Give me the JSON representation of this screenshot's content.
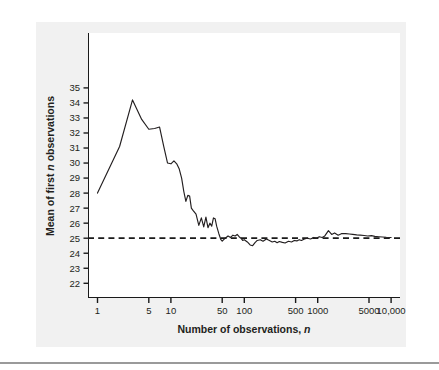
{
  "figure": {
    "background_color": "#f1f1f1",
    "plot_background_color": "#ffffff",
    "axis_color": "#1a1a1a",
    "line_color": "#231f20",
    "rule_color": "#9a9a9a"
  },
  "axes": {
    "x_title_main": "Number of observations,",
    "x_title_italic": "n",
    "y_title_part1": "Mean of first",
    "y_title_italic": "n",
    "y_title_part2": "observations"
  },
  "chart_data": {
    "type": "line",
    "title": "",
    "xlabel": "Number of observations, n",
    "ylabel": "Mean of first n observations",
    "xscale": "log",
    "xlim": [
      1,
      10000
    ],
    "ylim": [
      21.6,
      35.5
    ],
    "grid": false,
    "legend": "none",
    "xticks": [
      1,
      5,
      10,
      50,
      100,
      500,
      1000,
      5000,
      10000
    ],
    "xticklabels": [
      "1",
      "5",
      "10",
      "50",
      "100",
      "500",
      "1000",
      "5000",
      "10,000"
    ],
    "yticks": [
      22,
      23,
      24,
      25,
      26,
      27,
      28,
      29,
      30,
      31,
      32,
      33,
      34,
      35
    ],
    "yticklabels": [
      "22",
      "23",
      "24",
      "25",
      "26",
      "27",
      "28",
      "29",
      "30",
      "31",
      "32",
      "33",
      "34",
      "35"
    ],
    "reference_line": {
      "value": 25,
      "style": "dashed",
      "label": ""
    },
    "series": [
      {
        "name": "Running mean",
        "x": [
          1,
          2,
          3,
          4,
          5,
          6,
          7,
          8,
          9,
          10,
          11,
          12,
          13,
          14,
          15,
          16,
          17,
          18,
          19,
          20,
          22,
          24,
          26,
          28,
          30,
          32,
          34,
          36,
          38,
          40,
          42,
          45,
          48,
          50,
          55,
          60,
          65,
          70,
          75,
          80,
          85,
          90,
          95,
          100,
          110,
          120,
          130,
          140,
          150,
          165,
          180,
          200,
          220,
          240,
          260,
          280,
          300,
          330,
          360,
          400,
          440,
          480,
          520,
          560,
          600,
          660,
          720,
          800,
          880,
          960,
          1050,
          1150,
          1250,
          1400,
          1550,
          1700,
          1900,
          2100,
          2400,
          2700,
          3000,
          3400,
          3800,
          4300,
          4800,
          5400,
          6000,
          6800,
          7600,
          8600,
          10000
        ],
        "y": [
          28.0,
          31.1,
          34.2,
          32.9,
          32.25,
          32.3,
          32.4,
          31.1,
          30.0,
          29.95,
          30.15,
          29.95,
          29.6,
          29.0,
          28.1,
          27.45,
          27.85,
          27.8,
          27.0,
          26.85,
          26.6,
          25.85,
          26.35,
          25.75,
          26.4,
          25.7,
          26.0,
          25.8,
          26.35,
          26.3,
          25.8,
          25.3,
          24.9,
          24.8,
          25.0,
          25.15,
          25.05,
          25.2,
          25.15,
          25.25,
          25.1,
          25.0,
          24.85,
          24.9,
          24.75,
          24.55,
          24.5,
          24.7,
          24.85,
          24.9,
          24.8,
          24.95,
          24.85,
          24.75,
          24.8,
          24.7,
          24.78,
          24.72,
          24.68,
          24.8,
          24.75,
          24.85,
          24.82,
          24.9,
          24.85,
          24.95,
          25.0,
          24.95,
          25.05,
          25.0,
          25.1,
          25.05,
          25.15,
          25.5,
          25.25,
          25.35,
          25.2,
          25.3,
          25.3,
          25.28,
          25.25,
          25.22,
          25.2,
          25.18,
          25.15,
          25.17,
          25.12,
          25.1,
          25.08,
          25.06,
          25.05
        ]
      }
    ]
  }
}
